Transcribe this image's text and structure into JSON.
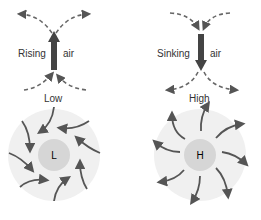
{
  "low": {
    "vertical_label_left": "Rising",
    "vertical_label_right": "air",
    "title": "Low",
    "center_letter": "L",
    "air_motion": "inward-counterclockwise"
  },
  "high": {
    "vertical_label_left": "Sinking",
    "vertical_label_right": "air",
    "title": "High",
    "center_letter": "H",
    "air_motion": "outward-clockwise"
  },
  "colors": {
    "arrow": "#555555",
    "outer_disc": "#f0f0f0",
    "inner_disc": "#d6d6d6",
    "vertical_arrow": "#444444"
  }
}
